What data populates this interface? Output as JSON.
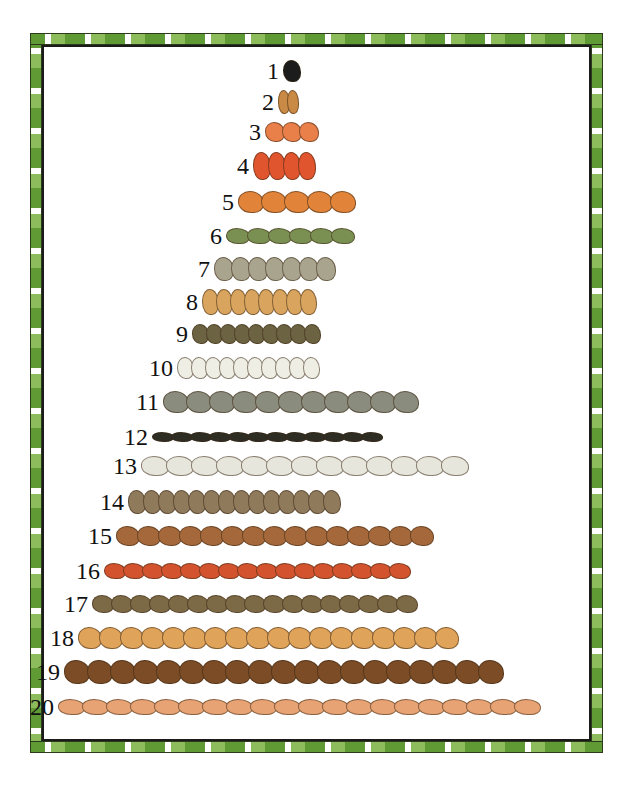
{
  "illustration": {
    "title": "Counting pyramid 1 to 20",
    "border_colors": {
      "dark": "#5f9a35",
      "light": "#8cbc5c",
      "line": "#2b3a1a"
    },
    "rows": [
      {
        "number": "1",
        "animal": "panda",
        "count": 1,
        "color": "#1c1c1c",
        "top": 57,
        "left": 283,
        "w": 18,
        "h": 22
      },
      {
        "number": "2",
        "animal": "giraffe",
        "count": 2,
        "color": "#c98a45",
        "top": 88,
        "left": 278,
        "w": 12,
        "h": 24
      },
      {
        "number": "3",
        "animal": "starfish",
        "count": 3,
        "color": "#e9804a",
        "top": 118,
        "left": 265,
        "w": 20,
        "h": 20
      },
      {
        "number": "4",
        "animal": "parrot",
        "count": 4,
        "color": "#e0542e",
        "top": 152,
        "left": 253,
        "w": 18,
        "h": 28
      },
      {
        "number": "5",
        "animal": "tiger",
        "count": 5,
        "color": "#e1843a",
        "top": 188,
        "left": 238,
        "w": 26,
        "h": 22
      },
      {
        "number": "6",
        "animal": "crocodile",
        "count": 6,
        "color": "#7a8f52",
        "top": 222,
        "left": 226,
        "w": 24,
        "h": 16
      },
      {
        "number": "7",
        "animal": "ape",
        "count": 7,
        "color": "#a8a48e",
        "top": 255,
        "left": 214,
        "w": 20,
        "h": 24
      },
      {
        "number": "8",
        "animal": "llama",
        "count": 8,
        "color": "#d9a45e",
        "top": 288,
        "left": 202,
        "w": 17,
        "h": 26
      },
      {
        "number": "9",
        "animal": "bird",
        "count": 9,
        "color": "#6b6341",
        "top": 320,
        "left": 192,
        "w": 17,
        "h": 20
      },
      {
        "number": "10",
        "animal": "goat",
        "count": 10,
        "color": "#eeeee4",
        "top": 354,
        "left": 177,
        "w": 17,
        "h": 22
      },
      {
        "number": "11",
        "animal": "elephant",
        "count": 11,
        "color": "#8a8c7d",
        "top": 388,
        "left": 163,
        "w": 26,
        "h": 22
      },
      {
        "number": "12",
        "animal": "beetle",
        "count": 12,
        "color": "#2e2d24",
        "top": 423,
        "left": 152,
        "w": 22,
        "h": 10
      },
      {
        "number": "13",
        "animal": "beluga whale",
        "count": 13,
        "color": "#e7e6dd",
        "top": 452,
        "left": 141,
        "w": 28,
        "h": 20
      },
      {
        "number": "14",
        "animal": "penguin",
        "count": 14,
        "color": "#8f7a5c",
        "top": 488,
        "left": 128,
        "w": 18,
        "h": 24
      },
      {
        "number": "15",
        "animal": "kangaroo",
        "count": 15,
        "color": "#a5683a",
        "top": 522,
        "left": 116,
        "w": 24,
        "h": 20
      },
      {
        "number": "16",
        "animal": "crab",
        "count": 16,
        "color": "#d2532d",
        "top": 557,
        "left": 104,
        "w": 22,
        "h": 16
      },
      {
        "number": "17",
        "animal": "turtle",
        "count": 17,
        "color": "#7c6a47",
        "top": 590,
        "left": 92,
        "w": 22,
        "h": 18
      },
      {
        "number": "18",
        "animal": "meerkat",
        "count": 18,
        "color": "#e0a35a",
        "top": 624,
        "left": 78,
        "w": 24,
        "h": 22
      },
      {
        "number": "19",
        "animal": "walrus",
        "count": 19,
        "color": "#7b4c26",
        "top": 658,
        "left": 64,
        "w": 26,
        "h": 24
      },
      {
        "number": "20",
        "animal": "fish",
        "count": 20,
        "color": "#e7a374",
        "top": 693,
        "left": 58,
        "w": 27,
        "h": 16
      }
    ]
  }
}
